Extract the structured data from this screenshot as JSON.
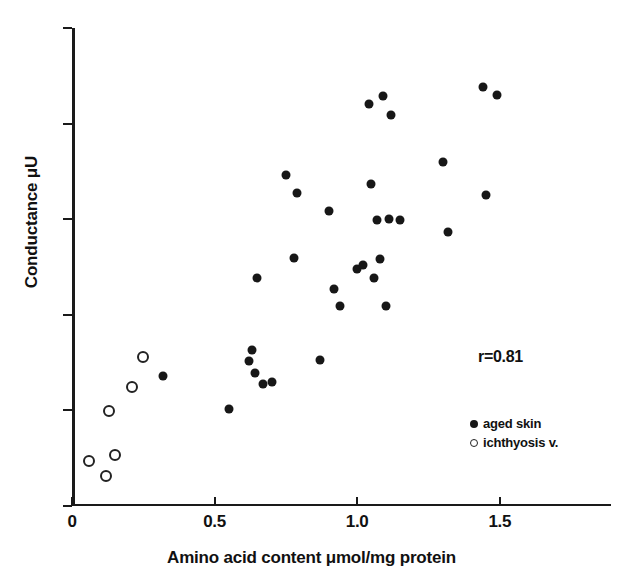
{
  "chart_data": {
    "type": "scatter",
    "title": "",
    "xlabel": "Amino acid content μmol/mg protein",
    "ylabel": "Conductance μU",
    "xlim": [
      0,
      1.89
    ],
    "ylim": [
      0,
      50
    ],
    "grid": false,
    "xticks": [
      0,
      0.5,
      1.0,
      1.5
    ],
    "xtick_labels": [
      "0",
      "0.5",
      "1.0",
      "1.5"
    ],
    "yticks": [
      0,
      10,
      20,
      30,
      40,
      50
    ],
    "ytick_labels": [
      "0",
      "10",
      "20",
      "30",
      "40",
      "50"
    ],
    "annotations": [
      {
        "name": "correlation",
        "text": "r=0.81"
      }
    ],
    "legend_position": "lower-right",
    "series": [
      {
        "name": "aged skin",
        "marker": "filled-circle",
        "color": "#171717",
        "points": [
          [
            0.32,
            13.6
          ],
          [
            0.55,
            10.1
          ],
          [
            0.62,
            15.2
          ],
          [
            0.63,
            16.3
          ],
          [
            0.64,
            13.9
          ],
          [
            0.65,
            23.9
          ],
          [
            0.67,
            12.8
          ],
          [
            0.7,
            13.0
          ],
          [
            0.75,
            34.6
          ],
          [
            0.78,
            25.9
          ],
          [
            0.79,
            32.7
          ],
          [
            0.87,
            15.3
          ],
          [
            0.9,
            30.9
          ],
          [
            0.92,
            22.7
          ],
          [
            0.94,
            20.9
          ],
          [
            1.0,
            24.8
          ],
          [
            1.02,
            25.2
          ],
          [
            1.04,
            42.1
          ],
          [
            1.05,
            33.7
          ],
          [
            1.06,
            23.8
          ],
          [
            1.07,
            29.9
          ],
          [
            1.08,
            25.8
          ],
          [
            1.09,
            42.9
          ],
          [
            1.1,
            20.9
          ],
          [
            1.11,
            30.0
          ],
          [
            1.12,
            40.9
          ],
          [
            1.15,
            29.9
          ],
          [
            1.3,
            36.0
          ],
          [
            1.32,
            28.7
          ],
          [
            1.44,
            43.8
          ],
          [
            1.45,
            32.5
          ],
          [
            1.49,
            43.0
          ]
        ]
      },
      {
        "name": "ichthyosis v.",
        "marker": "open-circle",
        "color": "#222222",
        "points": [
          [
            0.06,
            4.7
          ],
          [
            0.12,
            3.1
          ],
          [
            0.13,
            9.9
          ],
          [
            0.15,
            5.3
          ],
          [
            0.21,
            12.4
          ],
          [
            0.25,
            15.6
          ]
        ]
      }
    ]
  },
  "axes": {
    "x_title": "Amino acid content μmol/mg protein",
    "y_title": "Conductance μU"
  },
  "annotation": {
    "correlation": "r=0.81"
  },
  "legend": {
    "items": [
      {
        "label": "aged skin",
        "marker": "filled"
      },
      {
        "label": "ichthyosis v.",
        "marker": "open"
      }
    ]
  }
}
